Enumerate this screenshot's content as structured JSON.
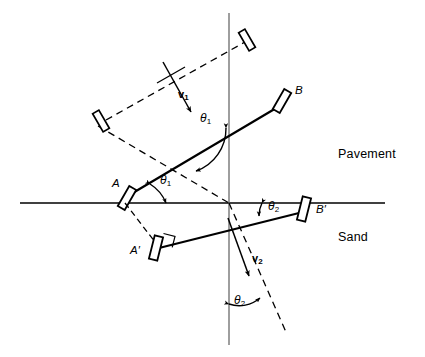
{
  "figure": {
    "width": 425,
    "height": 357,
    "background_color": "#ffffff",
    "stroke_color": "#000000",
    "guide_color": "#4d4d4d"
  },
  "regions": {
    "upper": {
      "label": "Pavement",
      "x": 338,
      "y": 154
    },
    "lower": {
      "label": "Sand",
      "x": 338,
      "y": 237
    }
  },
  "points": [
    {
      "name": "A",
      "label": "A",
      "x": 114,
      "y": 184
    },
    {
      "name": "B",
      "label": "B",
      "x": 295,
      "y": 90
    },
    {
      "name": "A'",
      "label": "A′",
      "x": 133,
      "y": 249
    },
    {
      "name": "B'",
      "label": "B′",
      "x": 315,
      "y": 208
    }
  ],
  "vectors": [
    {
      "name": "v1",
      "symbol": "v",
      "subscript": "1",
      "x": 180,
      "y": 95,
      "description": "incident velocity on pavement"
    },
    {
      "name": "v2",
      "symbol": "v",
      "subscript": "2",
      "x": 253,
      "y": 258,
      "description": "refracted velocity in sand"
    }
  ],
  "angles": [
    {
      "name": "theta1-normal",
      "symbol": "θ",
      "subscript": "1",
      "x": 204,
      "y": 117,
      "description": "angle of incidence between incident ray and normal"
    },
    {
      "name": "theta1-axle",
      "symbol": "θ",
      "subscript": "1",
      "x": 164,
      "y": 179,
      "description": "angle between axle AB and interface"
    },
    {
      "name": "theta2-axle",
      "symbol": "θ",
      "subscript": "2",
      "x": 270,
      "y": 205,
      "description": "angle between axle A'B' and interface"
    },
    {
      "name": "theta2-normal",
      "symbol": "θ",
      "subscript": "2",
      "x": 237,
      "y": 299,
      "description": "angle of refraction between refracted ray and normal"
    }
  ],
  "geometry": {
    "interface_line": {
      "x1": 20,
      "y1": 203,
      "x2": 385,
      "y2": 203
    },
    "normal_line": {
      "x1": 229,
      "y1": 13,
      "x2": 229,
      "y2": 345
    },
    "incident_ray": {
      "x1": 101,
      "y1": 128,
      "x2": 229,
      "y2": 203
    },
    "refracted_ray": {
      "x1": 229,
      "y1": 203,
      "x2": 285,
      "y2": 330
    },
    "upper_dashed_axle": {
      "x1": 104,
      "y1": 122,
      "x2": 246,
      "y2": 40
    },
    "solid_axle_AB": {
      "x1": 124,
      "y1": 196,
      "x2": 283,
      "y2": 104
    },
    "solid_axle_ApBp": {
      "x1": 158,
      "y1": 248,
      "x2": 304,
      "y2": 212
    },
    "dashed_A_to_Ap": {
      "x1": 124,
      "y1": 199,
      "x2": 156,
      "y2": 243
    }
  },
  "wheels": [
    {
      "name": "wheel-upper-left",
      "cx": 101,
      "cy": 121,
      "angle_deg": -30,
      "w": 7,
      "h": 21,
      "style": "solid"
    },
    {
      "name": "wheel-upper-right",
      "cx": 247,
      "cy": 40,
      "angle_deg": -30,
      "w": 7,
      "h": 21,
      "style": "solid"
    },
    {
      "name": "wheel-A",
      "cx": 126,
      "cy": 198,
      "angle_deg": 30,
      "w": 8,
      "h": 23,
      "style": "solid"
    },
    {
      "name": "wheel-B",
      "cx": 282,
      "cy": 101,
      "angle_deg": 30,
      "w": 8,
      "h": 23,
      "style": "solid"
    },
    {
      "name": "wheel-Aprime",
      "cx": 156,
      "cy": 248,
      "angle_deg": 14,
      "w": 8.5,
      "h": 24,
      "style": "solid"
    },
    {
      "name": "wheel-Bprime",
      "cx": 304,
      "cy": 209,
      "angle_deg": 14,
      "w": 8.5,
      "h": 24,
      "style": "solid"
    }
  ]
}
